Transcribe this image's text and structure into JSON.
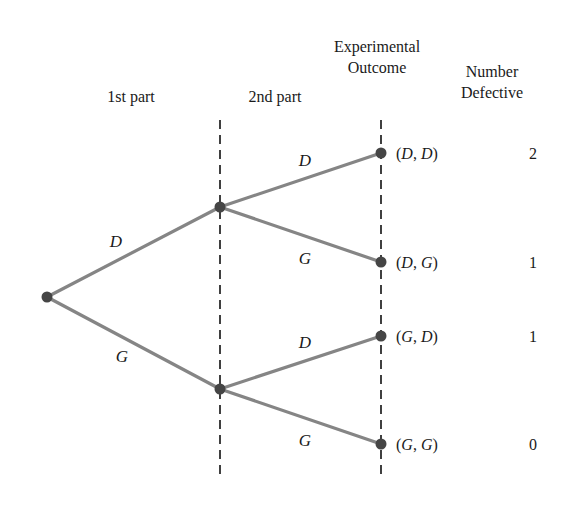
{
  "headers": {
    "first_part": "1st part",
    "second_part": "2nd part",
    "experimental_outcome_line1": "Experimental",
    "experimental_outcome_line2": "Outcome",
    "number_defective_line1": "Number",
    "number_defective_line2": "Defective"
  },
  "colors": {
    "branch_line": "#858585",
    "node": "#454545",
    "divider": "#111111",
    "text": "#1a1a1a"
  },
  "tree": {
    "root": {
      "x": 47,
      "y": 297
    },
    "stage1_nodes": [
      {
        "id": "D",
        "x": 220,
        "y": 207,
        "branch_label": "D"
      },
      {
        "id": "G",
        "x": 220,
        "y": 389,
        "branch_label": "G"
      }
    ],
    "leaves": [
      {
        "parent": "D",
        "x": 381,
        "y": 153,
        "branch_label": "D",
        "outcome_parts": [
          "D",
          "D"
        ],
        "number_defective": "2"
      },
      {
        "parent": "D",
        "x": 381,
        "y": 262,
        "branch_label": "G",
        "outcome_parts": [
          "D",
          "G"
        ],
        "number_defective": "1"
      },
      {
        "parent": "G",
        "x": 381,
        "y": 336,
        "branch_label": "D",
        "outcome_parts": [
          "G",
          "D"
        ],
        "number_defective": "1"
      },
      {
        "parent": "G",
        "x": 381,
        "y": 444,
        "branch_label": "G",
        "outcome_parts": [
          "G",
          "G"
        ],
        "number_defective": "0"
      }
    ],
    "dividers": [
      {
        "x": 220,
        "y1": 120,
        "y2": 480
      },
      {
        "x": 381,
        "y1": 120,
        "y2": 480
      }
    ]
  },
  "labels": {
    "stage1_D": "D",
    "stage1_G": "G",
    "stage2_DD": "D",
    "stage2_DG": "G",
    "stage2_GD": "D",
    "stage2_GG": "G"
  },
  "outcomes": [
    {
      "open": "(",
      "a": "D",
      "sep": ", ",
      "b": "D",
      "close": ")",
      "count": "2"
    },
    {
      "open": "(",
      "a": "D",
      "sep": ", ",
      "b": "G",
      "close": ")",
      "count": "1"
    },
    {
      "open": "(",
      "a": "G",
      "sep": ", ",
      "b": "D",
      "close": ")",
      "count": "1"
    },
    {
      "open": "(",
      "a": "G",
      "sep": ", ",
      "b": "G",
      "close": ")",
      "count": "0"
    }
  ]
}
